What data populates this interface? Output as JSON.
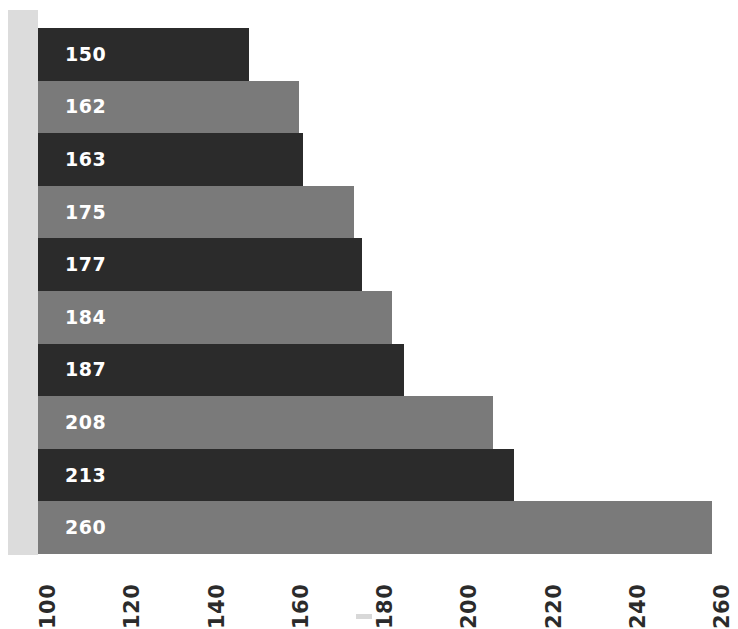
{
  "chart_data": {
    "type": "bar",
    "orientation": "horizontal",
    "title": "",
    "subtitle": "",
    "xlabel": "",
    "ylabel": "",
    "xlim": [
      100,
      260
    ],
    "x_tick_labels": [
      "100",
      "120",
      "140",
      "160",
      "180",
      "200",
      "220",
      "240",
      "260"
    ],
    "x_ticks": [
      100,
      120,
      140,
      160,
      180,
      200,
      220,
      240,
      260
    ],
    "grid": false,
    "legend": "none",
    "baseline": 100,
    "categories": [
      "",
      "",
      "",
      "",
      "",
      "",
      "",
      "",
      "",
      ""
    ],
    "values": [
      150,
      162,
      163,
      175,
      177,
      184,
      187,
      208,
      213,
      260
    ],
    "data_labels": [
      "150",
      "162",
      "163",
      "175",
      "177",
      "184",
      "187",
      "208",
      "213",
      "260"
    ],
    "bar_colors": [
      "#2b2b2b",
      "#7a7a7a",
      "#2b2b2b",
      "#7a7a7a",
      "#2b2b2b",
      "#7a7a7a",
      "#2b2b2b",
      "#7a7a7a",
      "#2b2b2b",
      "#7a7a7a"
    ],
    "bars": [
      {
        "label": "150",
        "value": 150,
        "color": "#2b2b2b",
        "style": "dark"
      },
      {
        "label": "162",
        "value": 162,
        "color": "#7a7a7a",
        "style": "light"
      },
      {
        "label": "163",
        "value": 163,
        "color": "#2b2b2b",
        "style": "dark"
      },
      {
        "label": "175",
        "value": 175,
        "color": "#7a7a7a",
        "style": "light"
      },
      {
        "label": "177",
        "value": 177,
        "color": "#2b2b2b",
        "style": "dark"
      },
      {
        "label": "184",
        "value": 184,
        "color": "#7a7a7a",
        "style": "light"
      },
      {
        "label": "187",
        "value": 187,
        "color": "#2b2b2b",
        "style": "dark"
      },
      {
        "label": "208",
        "value": 208,
        "color": "#7a7a7a",
        "style": "light"
      },
      {
        "label": "213",
        "value": 213,
        "color": "#2b2b2b",
        "style": "dark"
      },
      {
        "label": "260",
        "value": 260,
        "color": "#7a7a7a",
        "style": "light"
      }
    ]
  },
  "colors": {
    "bar_dark": "#2b2b2b",
    "bar_light": "#7a7a7a",
    "left_band": "#dcdcdc",
    "background": "#ffffff",
    "label_text": "#ffffff",
    "tick_text": "#2b2b2b"
  }
}
